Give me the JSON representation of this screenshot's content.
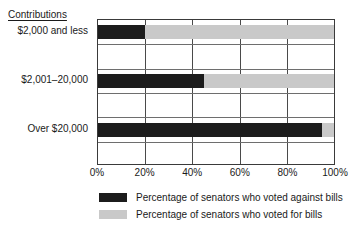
{
  "chart_data": {
    "type": "bar",
    "orientation": "horizontal",
    "stacked": true,
    "title": "",
    "xlabel": "",
    "ylabel": "Contributions",
    "categories": [
      "$2,000 and less",
      "$2,001–20,000",
      "Over $20,000"
    ],
    "series": [
      {
        "name": "Percentage of senators who voted against bills",
        "color": "#1c1c1c",
        "values": [
          20,
          45,
          95
        ]
      },
      {
        "name": "Percentage of senators who voted for bills",
        "color": "#c9c9c9",
        "values": [
          80,
          55,
          5
        ]
      }
    ],
    "xlim": [
      0,
      100
    ],
    "xticks": [
      0,
      20,
      40,
      60,
      80,
      100
    ],
    "xtick_labels": [
      "0%",
      "20%",
      "40%",
      "60%",
      "80%",
      "100%"
    ],
    "grid": true,
    "legend_position": "bottom"
  },
  "axis_title": "Contributions",
  "legend": {
    "items": [
      {
        "label": "Percentage of senators who voted against bills",
        "color": "#1c1c1c"
      },
      {
        "label": "Percentage of senators who voted for bills",
        "color": "#c9c9c9"
      }
    ]
  }
}
